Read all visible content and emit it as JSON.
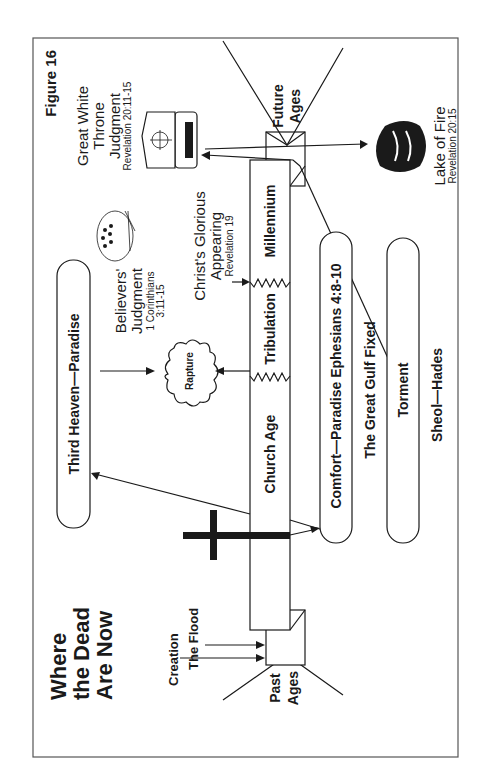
{
  "figure_label": "Figure 16",
  "title": [
    "Where",
    "the Dead",
    "Are Now"
  ],
  "timeline": {
    "past_ages": [
      "Past",
      "Ages"
    ],
    "future_ages": [
      "Future",
      "Ages"
    ],
    "creation": "Creation",
    "the_flood": "The Flood",
    "segments": [
      "Church Age",
      "Tribulation",
      "Millennium"
    ]
  },
  "heaven": {
    "third_heaven": "Third Heaven—Paradise",
    "rapture": "Rapture",
    "believers_judgment": [
      "Believers'",
      "Judgment"
    ],
    "believers_ref": [
      "1 Corinthians",
      "3:11-15"
    ],
    "glorious_appearing": [
      "Christ's Glorious",
      "Appearing"
    ],
    "glorious_ref": "Revelation 19"
  },
  "judgment": {
    "gwt": [
      "Great White",
      "Throne",
      "Judgment"
    ],
    "gwt_ref": "Revelation 20:11-15",
    "lake_of_fire": "Lake of Fire",
    "lake_ref": "Revelation 20:15"
  },
  "sheol": {
    "comfort": "Comfort—Paradise Ephesians 4:8-10",
    "gulf": "The Great Gulf Fixed",
    "torment": "Torment",
    "label": "Sheol—Hades"
  },
  "icons": [
    "cross-icon",
    "cloud-icon",
    "throne-icon",
    "fire-icon",
    "crowd-icon"
  ],
  "colors": {
    "ink": "#1a1a1a",
    "border": "#555555",
    "paper": "#ffffff"
  }
}
